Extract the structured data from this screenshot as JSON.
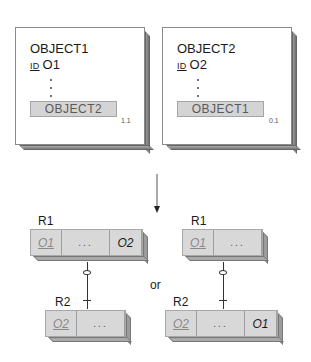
{
  "objects": [
    {
      "name": "OBJECT1",
      "id_label": "ID",
      "id_value": "O1",
      "dots": [
        ".",
        ".",
        "."
      ],
      "reference": "OBJECT2",
      "cardinality": "1.1"
    },
    {
      "name": "OBJECT2",
      "id_label": "ID",
      "id_value": "O2",
      "dots": [
        ".",
        ".",
        "."
      ],
      "reference": "OBJECT1",
      "cardinality": "0.1"
    }
  ],
  "arrow": "down",
  "options": [
    {
      "relations": [
        {
          "label": "R1",
          "cells": [
            "O1",
            "...",
            "O2"
          ]
        },
        {
          "label": "R2",
          "cells": [
            "O2",
            "..."
          ]
        }
      ]
    },
    {
      "relations": [
        {
          "label": "R1",
          "cells": [
            "O1",
            "..."
          ]
        },
        {
          "label": "R2",
          "cells": [
            "O2",
            "...",
            "O1"
          ]
        }
      ]
    }
  ],
  "separator": "or",
  "colors": {
    "relation_fill": "#d8d8d8",
    "reference_fill": "#d4d4d4",
    "shadow": "#8a8a8a"
  }
}
